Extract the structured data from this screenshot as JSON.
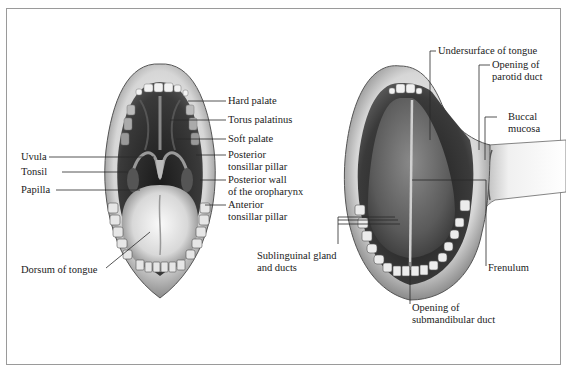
{
  "figure": {
    "left_panel": {
      "view": "open-mouth-palate",
      "labels_right": [
        {
          "id": "hard-palate",
          "text": "Hard palate"
        },
        {
          "id": "torus-palatinus",
          "text": "Torus palatinus"
        },
        {
          "id": "soft-palate",
          "text": "Soft palate"
        },
        {
          "id": "posterior-tonsillar-pillar",
          "text": "Posterior\ntonsillar pillar"
        },
        {
          "id": "posterior-wall-oropharynx",
          "text": "Posterior wall\nof the oropharynx"
        },
        {
          "id": "anterior-tonsillar-pillar",
          "text": "Anterior\ntonsillar pillar"
        }
      ],
      "labels_left": [
        {
          "id": "uvula",
          "text": "Uvula"
        },
        {
          "id": "tonsil",
          "text": "Tonsil"
        },
        {
          "id": "papilla",
          "text": "Papilla"
        },
        {
          "id": "dorsum-of-tongue",
          "text": "Dorsum of tongue"
        }
      ]
    },
    "right_panel": {
      "view": "raised-tongue-floor-of-mouth",
      "labels": [
        {
          "id": "undersurface-of-tongue",
          "text": "Undersurface of tongue"
        },
        {
          "id": "opening-parotid-duct",
          "text": "Opening of\nparotid duct"
        },
        {
          "id": "buccal-mucosa",
          "text": "Buccal\nmucosa"
        },
        {
          "id": "sublingual-gland-ducts",
          "text": "Sublinguinal gland\nand ducts"
        },
        {
          "id": "frenulum",
          "text": "Frenulum"
        },
        {
          "id": "opening-submandibular-duct",
          "text": "Opening of\nsubmandibular duct"
        }
      ]
    },
    "colors": {
      "frame": "#9a9a9a",
      "leader_line": "#2a2a2a",
      "text": "#1a1a1a",
      "lip": "#bdbdbd",
      "cavity_dark": "#2b2b2b",
      "tongue_light": "#e8e8e8",
      "tooth": "#f2f2f2"
    }
  }
}
